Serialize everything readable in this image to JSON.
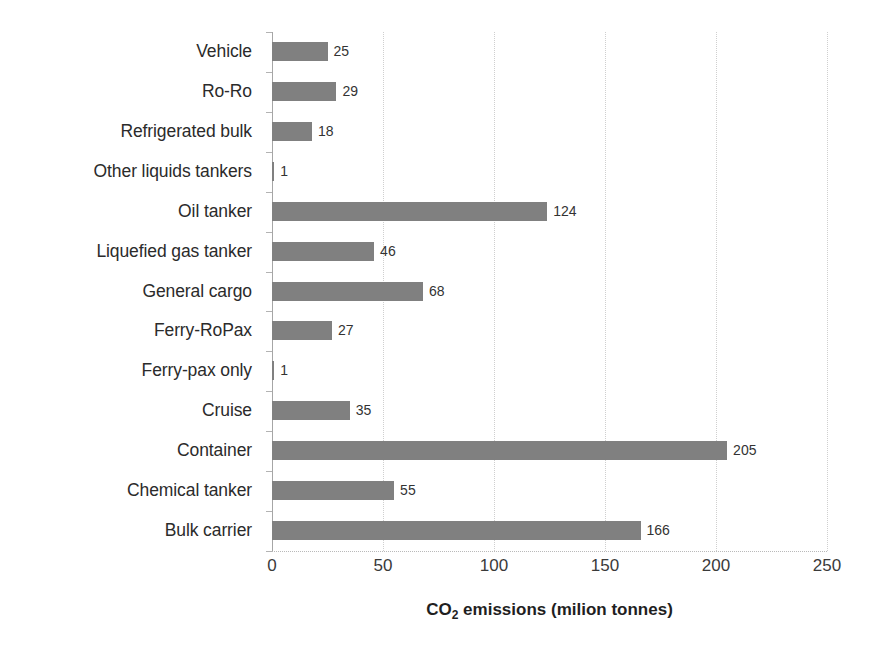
{
  "chart_data": {
    "type": "bar",
    "orientation": "horizontal",
    "title": "",
    "xlabel": "CO2 emissions (milion tonnes)",
    "xlabel_parts": {
      "pre": "CO",
      "sub": "2",
      "post": " emissions (milion tonnes)"
    },
    "ylabel": "",
    "xlim": [
      0,
      250
    ],
    "xticks": [
      0,
      50,
      100,
      150,
      200,
      250
    ],
    "xticklabels": [
      "0",
      "50",
      "100",
      "150",
      "200",
      "250"
    ],
    "grid": "vertical-dotted",
    "legend": "none",
    "bar_color": "#808080",
    "categories": [
      "Vehicle",
      "Ro-Ro",
      "Refrigerated bulk",
      "Other liquids tankers",
      "Oil tanker",
      "Liquefied gas tanker",
      "General cargo",
      "Ferry-RoPax",
      "Ferry-pax only",
      "Cruise",
      "Container",
      "Chemical tanker",
      "Bulk carrier"
    ],
    "values": [
      25,
      29,
      18,
      1,
      124,
      46,
      68,
      27,
      1,
      35,
      205,
      55,
      166
    ],
    "data_labels": [
      "25",
      "29",
      "18",
      "1",
      "124",
      "46",
      "68",
      "27",
      "1",
      "35",
      "205",
      "55",
      "166"
    ]
  }
}
